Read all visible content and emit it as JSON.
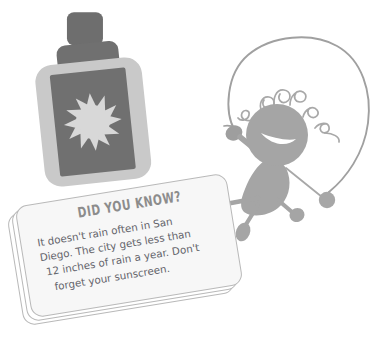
{
  "scene": {
    "width": 386,
    "height": 347,
    "background": "#ffffff",
    "description": "Illustration of a sunscreen bottle and a jump-roping stick figure holding a 'Did You Know?' fact card"
  },
  "palette": {
    "background": "#ffffff",
    "figure_gray": "#a5a5a5",
    "rope_gray": "#9a9a9a",
    "bottle_body": "#c9c9c9",
    "bottle_label": "#707070",
    "bottle_cap": "#6e6e6e",
    "bottle_neck": "#707070",
    "sun_icon": "#d8d8d8",
    "card_fill": "#f7f7f7",
    "card_border": "#b9b9b9",
    "title_text": "#8c8c8c",
    "body_text": "#63636a"
  },
  "fact_card": {
    "title": "DID YOU KNOW?",
    "body_lines": [
      "It doesn't rain often in San",
      "Diego. The city gets less than",
      "12 inches of rain a year. Don't",
      "forget your sunscreen."
    ],
    "body_text": "It doesn't rain often in San Diego. The city gets less than 12 inches of rain a year. Don't forget your sunscreen.",
    "rotation_degrees": -9.2,
    "card_count": 3
  },
  "illustrations": {
    "sunscreen_bottle": {
      "name": "sunscreen-bottle",
      "label_icon": "sun-icon",
      "sun_ray_count": 12,
      "rotation_degrees": -6
    },
    "jump_rope_figure": {
      "name": "jump-roping-stick-figure",
      "parts": [
        "curly-hair",
        "head-with-smile",
        "body",
        "left-arm",
        "right-arm",
        "left-leg",
        "right-leg",
        "jump-rope",
        "rope-handle-left",
        "rope-handle-right"
      ],
      "facial_expression": "smile"
    }
  }
}
